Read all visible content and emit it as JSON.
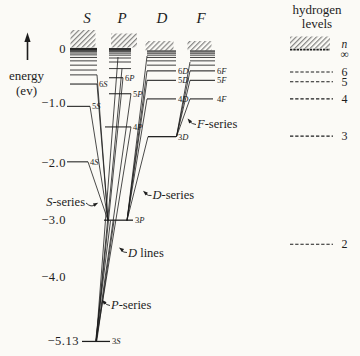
{
  "figure": {
    "background_color": "#fbfaf6",
    "ink_color": "#1d1d1d"
  },
  "energy_axis": {
    "label_line1": "energy",
    "label_line2": "(ev)",
    "arrow_direction": "up",
    "tick_labels": [
      "0",
      "−1.0",
      "−2.0",
      "−3.0",
      "−4.0",
      "−5.13"
    ],
    "tick_values_ev": [
      0,
      -1.0,
      -2.0,
      -3.0,
      -4.0,
      -5.13
    ]
  },
  "sodium_columns": [
    {
      "id": "S",
      "header": "S",
      "labeled_levels": [
        {
          "label": "3S",
          "energy_ev": -5.13
        },
        {
          "label": "4S",
          "energy_ev": -1.99
        },
        {
          "label": "5S",
          "energy_ev": -1.02
        },
        {
          "label": "6S",
          "energy_ev": -0.63
        }
      ],
      "unlabeled_levels_ev": [
        -0.47,
        -0.385,
        -0.3,
        -0.225,
        -0.165,
        -0.12,
        -0.088,
        -0.064,
        -0.047,
        -0.034,
        -0.025,
        -0.018,
        -0.012,
        -0.007
      ]
    },
    {
      "id": "P",
      "header": "P",
      "labeled_levels": [
        {
          "label": "3P",
          "energy_ev": -3.01
        },
        {
          "label": "4P",
          "energy_ev": -1.38
        },
        {
          "label": "5P",
          "energy_ev": -0.8
        },
        {
          "label": "6P",
          "energy_ev": -0.52
        }
      ],
      "unlabeled_levels_ev": [
        -0.36,
        -0.245,
        -0.175,
        -0.125,
        -0.09,
        -0.065,
        -0.047,
        -0.033,
        -0.023,
        -0.016,
        -0.01
      ]
    },
    {
      "id": "D",
      "header": "D",
      "labeled_levels": [
        {
          "label": "3D",
          "energy_ev": -1.55
        },
        {
          "label": "4D",
          "energy_ev": -0.89
        },
        {
          "label": "5D",
          "energy_ev": -0.565
        },
        {
          "label": "6D",
          "energy_ev": -0.4
        }
      ],
      "unlabeled_levels_ev": [
        -0.3,
        -0.225,
        -0.165,
        -0.125,
        -0.092,
        -0.068,
        -0.05
      ]
    },
    {
      "id": "F",
      "header": "F",
      "labeled_levels": [
        {
          "label": "4F",
          "energy_ev": -0.89
        },
        {
          "label": "5F",
          "energy_ev": -0.565
        },
        {
          "label": "6F",
          "energy_ev": -0.4
        }
      ],
      "unlabeled_levels_ev": [
        -0.3,
        -0.225,
        -0.165,
        -0.125,
        -0.092,
        -0.068,
        -0.05
      ]
    }
  ],
  "hydrogen_panel": {
    "title_line1": "hydrogen",
    "title_line2": "levels",
    "limit_symbol_n": "n",
    "limit_symbol_infinity": "∞",
    "levels": [
      {
        "label": "6",
        "energy_ev": -0.42
      },
      {
        "label": "5",
        "energy_ev": -0.59
      },
      {
        "label": "4",
        "energy_ev": -0.89
      },
      {
        "label": "3",
        "energy_ev": -1.54
      },
      {
        "label": "2",
        "energy_ev": -3.43
      }
    ]
  },
  "series_annotations": [
    {
      "id": "s_series",
      "text": "S-series"
    },
    {
      "id": "d_series",
      "text": "D-series"
    },
    {
      "id": "d_lines",
      "text": "D lines"
    },
    {
      "id": "p_series",
      "text": "P-series"
    },
    {
      "id": "f_series",
      "text": "F-series"
    }
  ],
  "transitions": [
    {
      "series": "S-series",
      "lower_level": "3P",
      "upper_levels": [
        "7S",
        "6S",
        "5S",
        "4S"
      ]
    },
    {
      "series": "P-series",
      "lower_level": "3S",
      "upper_levels": [
        "8P",
        "7P",
        "6P",
        "5P",
        "4P"
      ]
    },
    {
      "series": "D-series",
      "lower_level": "3P",
      "upper_levels": [
        "7D",
        "6D",
        "5D",
        "4D",
        "3D"
      ]
    },
    {
      "series": "F-series",
      "lower_level": "3D",
      "upper_levels": [
        "7F",
        "6F",
        "5F",
        "4F"
      ]
    },
    {
      "series": "D lines",
      "lower_level": "3S",
      "upper_levels": [
        "3P",
        "3P"
      ]
    }
  ]
}
